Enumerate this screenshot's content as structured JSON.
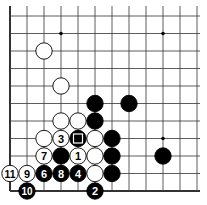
{
  "diagram": {
    "type": "go-board-corner",
    "corner": "bottom-left",
    "columns_shown": 12,
    "rows_shown": 11,
    "colors": {
      "black": "#000000",
      "white": "#ffffff",
      "line": "#333333"
    },
    "star_points": [
      {
        "col": 3,
        "row": 9
      },
      {
        "col": 9,
        "row": 9
      },
      {
        "col": 9,
        "row": 3
      }
    ],
    "stones": [
      {
        "col": 2,
        "row": 8,
        "color": "white",
        "label": ""
      },
      {
        "col": 3,
        "row": 6,
        "color": "white",
        "label": ""
      },
      {
        "col": 5,
        "row": 5,
        "color": "black",
        "label": ""
      },
      {
        "col": 7,
        "row": 5,
        "color": "black",
        "label": ""
      },
      {
        "col": 3,
        "row": 4,
        "color": "white",
        "label": ""
      },
      {
        "col": 4,
        "row": 4,
        "color": "white",
        "label": ""
      },
      {
        "col": 5,
        "row": 4,
        "color": "black",
        "label": ""
      },
      {
        "col": 2,
        "row": 3,
        "color": "white",
        "label": ""
      },
      {
        "col": 3,
        "row": 3,
        "color": "white",
        "label": "3"
      },
      {
        "col": 4,
        "row": 3,
        "color": "black",
        "label": "",
        "marker": "square"
      },
      {
        "col": 5,
        "row": 3,
        "color": "white",
        "label": ""
      },
      {
        "col": 6,
        "row": 3,
        "color": "black",
        "label": ""
      },
      {
        "col": 2,
        "row": 2,
        "color": "white",
        "label": "7"
      },
      {
        "col": 3,
        "row": 2,
        "color": "black",
        "label": ""
      },
      {
        "col": 4,
        "row": 2,
        "color": "white",
        "label": "1"
      },
      {
        "col": 5,
        "row": 2,
        "color": "white",
        "label": ""
      },
      {
        "col": 6,
        "row": 2,
        "color": "black",
        "label": ""
      },
      {
        "col": 9,
        "row": 2,
        "color": "black",
        "label": ""
      },
      {
        "col": 0,
        "row": 1,
        "color": "white",
        "label": "11"
      },
      {
        "col": 1,
        "row": 1,
        "color": "white",
        "label": "9"
      },
      {
        "col": 2,
        "row": 1,
        "color": "black",
        "label": "6"
      },
      {
        "col": 3,
        "row": 1,
        "color": "black",
        "label": "8"
      },
      {
        "col": 4,
        "row": 1,
        "color": "black",
        "label": "4"
      },
      {
        "col": 5,
        "row": 1,
        "color": "white",
        "label": ""
      },
      {
        "col": 6,
        "row": 1,
        "color": "black",
        "label": ""
      },
      {
        "col": 1,
        "row": 0,
        "color": "black",
        "label": "10"
      },
      {
        "col": 5,
        "row": 0,
        "color": "black",
        "label": "2"
      }
    ]
  }
}
